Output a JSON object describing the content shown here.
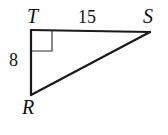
{
  "figure": {
    "kind": "right-triangle-diagram",
    "canvas": {
      "width": 168,
      "height": 135,
      "background": "#ffffff"
    },
    "stroke": {
      "color": "#1a1a1a",
      "triangle_width": 2.2,
      "marker_width": 1.1
    },
    "vertices": [
      {
        "name": "T",
        "label": "T",
        "x": 31,
        "y": 30
      },
      {
        "name": "S",
        "label": "S",
        "x": 150,
        "y": 32
      },
      {
        "name": "R",
        "label": "R",
        "x": 31,
        "y": 95
      }
    ],
    "sides": [
      {
        "name": "TS",
        "from": "T",
        "to": "S",
        "measure": "15",
        "role": "horizontal-leg"
      },
      {
        "name": "TR",
        "from": "T",
        "to": "R",
        "measure": "8",
        "role": "vertical-leg"
      },
      {
        "name": "RS",
        "from": "R",
        "to": "S",
        "measure": "",
        "role": "hypotenuse"
      }
    ],
    "right_angle": {
      "at": "T",
      "size": 21,
      "marker": "square"
    },
    "labels": {
      "vertex_T": "T",
      "vertex_S": "S",
      "vertex_R": "R",
      "side_TS": "15",
      "side_TR": "8"
    }
  }
}
